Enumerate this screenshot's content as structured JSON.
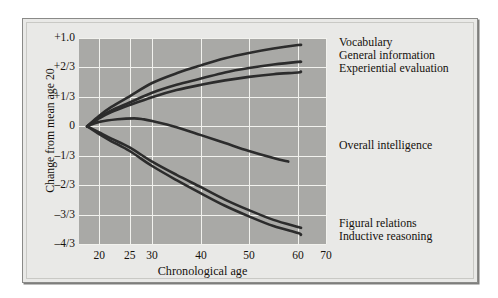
{
  "figure": {
    "background_color": "#e9e9e7",
    "plot_background_color": "#a9a9a6",
    "gridline_color": "#f2f2ee",
    "curve_color": "#2c2c2c"
  },
  "axes": {
    "y_title": "Change from mean age 20",
    "x_title": "Chronological age",
    "y_tick_labels": [
      "+1.0",
      "+2/3",
      "+1/3",
      "0",
      "–1/3",
      "–2/3",
      "–3/3",
      "–4/3"
    ],
    "x_tick_labels": [
      "20",
      "25",
      "30",
      "40",
      "50",
      "60",
      "70"
    ]
  },
  "legend": {
    "top_group": [
      "Vocabulary",
      "General information",
      "Experiential evaluation"
    ],
    "middle_group": [
      "Overall intelligence"
    ],
    "bottom_group": [
      "Figural relations",
      "Inductive reasoning"
    ]
  },
  "chart_data": {
    "type": "line",
    "title": "",
    "xlabel": "Chronological age",
    "ylabel": "Change from mean age 20",
    "xlim": [
      18,
      72
    ],
    "ylim": [
      -1.3333,
      1.0
    ],
    "grid": true,
    "legend_position": "right-inline-labels",
    "x_ticks": [
      20,
      25,
      30,
      40,
      50,
      60,
      70
    ],
    "x_tick_labels": [
      "20",
      "25",
      "30",
      "40",
      "50",
      "60",
      "70"
    ],
    "x_tick_fractions": [
      0.082,
      0.205,
      0.296,
      0.494,
      0.688,
      0.887,
      1.0
    ],
    "y_ticks": [
      1.0,
      0.6667,
      0.3333,
      0,
      -0.3333,
      -0.6667,
      -1.0,
      -1.3333
    ],
    "y_tick_labels": [
      "+1.0",
      "+2/3",
      "+1/3",
      "0",
      "–1/3",
      "–2/3",
      "–3/3",
      "–4/3"
    ],
    "series": [
      {
        "name": "Vocabulary",
        "color": "#2c2c2c",
        "x": [
          18,
          20,
          22,
          25,
          30,
          35,
          40,
          45,
          50,
          55,
          60,
          61
        ],
        "values": [
          0.0,
          0.12,
          0.22,
          0.34,
          0.49,
          0.6,
          0.69,
          0.77,
          0.83,
          0.88,
          0.92,
          0.92
        ]
      },
      {
        "name": "General information",
        "color": "#2c2c2c",
        "x": [
          18,
          20,
          22,
          25,
          30,
          35,
          40,
          45,
          50,
          55,
          60,
          61
        ],
        "values": [
          0.0,
          0.1,
          0.18,
          0.27,
          0.38,
          0.47,
          0.54,
          0.61,
          0.66,
          0.7,
          0.73,
          0.73
        ]
      },
      {
        "name": "Experiential evaluation",
        "color": "#2c2c2c",
        "x": [
          18,
          20,
          22,
          25,
          30,
          35,
          40,
          45,
          50,
          55,
          60,
          61
        ],
        "values": [
          0.0,
          0.09,
          0.16,
          0.24,
          0.33,
          0.41,
          0.47,
          0.52,
          0.56,
          0.59,
          0.61,
          0.62
        ]
      },
      {
        "name": "Overall intelligence",
        "color": "#2c2c2c",
        "x": [
          18,
          20,
          23,
          26,
          28,
          30,
          35,
          40,
          45,
          50,
          55,
          58
        ],
        "values": [
          0.0,
          0.05,
          0.08,
          0.09,
          0.08,
          0.06,
          -0.01,
          -0.1,
          -0.19,
          -0.28,
          -0.36,
          -0.4
        ]
      },
      {
        "name": "Figural relations",
        "color": "#2c2c2c",
        "x": [
          18,
          20,
          22,
          25,
          30,
          35,
          40,
          45,
          50,
          55,
          60,
          61
        ],
        "values": [
          0.0,
          -0.07,
          -0.14,
          -0.24,
          -0.4,
          -0.55,
          -0.69,
          -0.83,
          -0.95,
          -1.06,
          -1.14,
          -1.15
        ]
      },
      {
        "name": "Inductive reasoning",
        "color": "#2c2c2c",
        "x": [
          18,
          20,
          22,
          25,
          30,
          35,
          40,
          45,
          50,
          55,
          60,
          61
        ],
        "values": [
          0.0,
          -0.09,
          -0.17,
          -0.28,
          -0.45,
          -0.61,
          -0.76,
          -0.9,
          -1.02,
          -1.13,
          -1.21,
          -1.23
        ]
      }
    ]
  }
}
